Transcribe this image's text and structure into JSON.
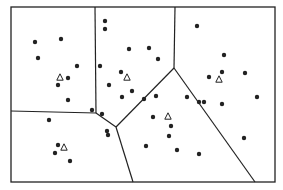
{
  "diagram": {
    "type": "voronoi-clustering",
    "width": 283,
    "height": 190,
    "ink_color": "#222222",
    "background_color": "#ffffff",
    "bounding_box": {
      "x1": 11,
      "y1": 7,
      "x2": 275,
      "y2": 182
    },
    "edges": [
      {
        "x1": 95,
        "y1": 7,
        "x2": 96,
        "y2": 113
      },
      {
        "x1": 175,
        "y1": 7,
        "x2": 174,
        "y2": 68
      },
      {
        "x1": 174,
        "y1": 68,
        "x2": 116,
        "y2": 127
      },
      {
        "x1": 174,
        "y1": 68,
        "x2": 255,
        "y2": 182
      },
      {
        "x1": 11,
        "y1": 111,
        "x2": 96,
        "y2": 113
      },
      {
        "x1": 96,
        "y1": 113,
        "x2": 116,
        "y2": 127
      },
      {
        "x1": 116,
        "y1": 127,
        "x2": 133,
        "y2": 182
      }
    ],
    "sites": [
      {
        "x": 60,
        "y": 77
      },
      {
        "x": 127,
        "y": 77
      },
      {
        "x": 219,
        "y": 79
      },
      {
        "x": 168,
        "y": 116
      },
      {
        "x": 64,
        "y": 147
      }
    ],
    "points": [
      {
        "x": 35,
        "y": 42
      },
      {
        "x": 61,
        "y": 39
      },
      {
        "x": 38,
        "y": 58
      },
      {
        "x": 77,
        "y": 66
      },
      {
        "x": 68,
        "y": 78
      },
      {
        "x": 58,
        "y": 85
      },
      {
        "x": 68,
        "y": 100
      },
      {
        "x": 92,
        "y": 110
      },
      {
        "x": 105,
        "y": 21
      },
      {
        "x": 105,
        "y": 29
      },
      {
        "x": 129,
        "y": 49
      },
      {
        "x": 149,
        "y": 48
      },
      {
        "x": 158,
        "y": 59
      },
      {
        "x": 100,
        "y": 66
      },
      {
        "x": 121,
        "y": 72
      },
      {
        "x": 109,
        "y": 85
      },
      {
        "x": 132,
        "y": 91
      },
      {
        "x": 122,
        "y": 97
      },
      {
        "x": 144,
        "y": 99
      },
      {
        "x": 102,
        "y": 114
      },
      {
        "x": 107,
        "y": 131
      },
      {
        "x": 197,
        "y": 26
      },
      {
        "x": 224,
        "y": 55
      },
      {
        "x": 209,
        "y": 77
      },
      {
        "x": 222,
        "y": 72
      },
      {
        "x": 245,
        "y": 73
      },
      {
        "x": 257,
        "y": 97
      },
      {
        "x": 187,
        "y": 97
      },
      {
        "x": 204,
        "y": 102
      },
      {
        "x": 222,
        "y": 104
      },
      {
        "x": 156,
        "y": 96
      },
      {
        "x": 153,
        "y": 117
      },
      {
        "x": 171,
        "y": 126
      },
      {
        "x": 146,
        "y": 146
      },
      {
        "x": 199,
        "y": 102
      },
      {
        "x": 244,
        "y": 138
      },
      {
        "x": 199,
        "y": 154
      },
      {
        "x": 177,
        "y": 150
      },
      {
        "x": 169,
        "y": 136
      },
      {
        "x": 49,
        "y": 120
      },
      {
        "x": 58,
        "y": 145
      },
      {
        "x": 55,
        "y": 153
      },
      {
        "x": 70,
        "y": 161
      },
      {
        "x": 108,
        "y": 135
      }
    ]
  }
}
